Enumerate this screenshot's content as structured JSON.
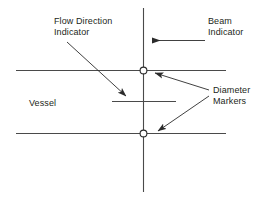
{
  "figure": {
    "background_color": "#ffffff",
    "line_color": "#3b3b3b",
    "text_color": "#231f20",
    "width": 274,
    "height": 208
  },
  "labels": {
    "flow_direction": {
      "line1": "Flow Direction",
      "line2": "Indicator"
    },
    "beam": {
      "line1": "Beam",
      "line2": "Indicator"
    },
    "diameter": {
      "line1": "Diameter",
      "line2": "Markers"
    },
    "vessel": {
      "line1": "Vessel"
    }
  },
  "elements": {
    "beam_line": "vertical-beam-line",
    "vessel_wall_upper": "upper-vessel-wall",
    "vessel_wall_lower": "lower-vessel-wall",
    "flow_indicator_line": "flow-direction-indicator-line",
    "marker_upper": "diameter-marker-upper",
    "marker_lower": "diameter-marker-lower",
    "leader_beam": "beam-indicator-leader-arrow",
    "leader_flow": "flow-direction-leader-arrow",
    "leader_diameter_upper": "diameter-marker-upper-leader-arrow",
    "leader_diameter_lower": "diameter-marker-lower-leader-arrow"
  }
}
